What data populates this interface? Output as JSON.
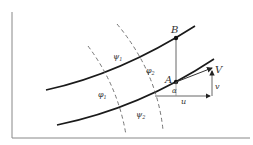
{
  "diagram": {
    "labels": {
      "point_b": "B",
      "point_a": "A",
      "velocity": "V",
      "v_component": "v",
      "u_component": "u",
      "angle": "α",
      "psi_1": "ψ",
      "psi_1_sub": "1",
      "psi_2": "ψ",
      "psi_2_sub": "2",
      "phi_1": "φ",
      "phi_1_sub": "1",
      "phi_2": "φ",
      "phi_2_sub": "2"
    },
    "colors": {
      "stroke": "#1a1a1a",
      "thin_stroke": "#555555",
      "axis": "#888888"
    }
  }
}
